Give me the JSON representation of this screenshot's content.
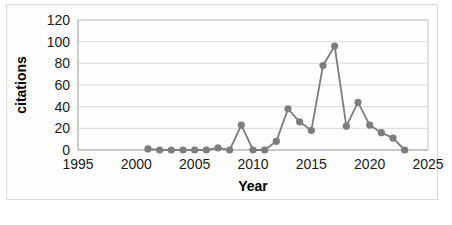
{
  "chart_data": {
    "type": "line",
    "title": "",
    "subtitle": "",
    "xlabel": "Year",
    "ylabel": "citations",
    "xlim": [
      1995,
      2025
    ],
    "ylim": [
      0,
      120
    ],
    "x_ticks": [
      1995,
      2000,
      2005,
      2010,
      2015,
      2020,
      2025
    ],
    "y_ticks": [
      0,
      20,
      40,
      60,
      80,
      100,
      120
    ],
    "grid": "horizontal",
    "legend": "none",
    "marker": "circle",
    "line_color": "#7d7d7d",
    "marker_color": "#7d7d7d",
    "x": [
      2001,
      2002,
      2003,
      2004,
      2005,
      2006,
      2007,
      2008,
      2009,
      2010,
      2011,
      2012,
      2013,
      2014,
      2015,
      2016,
      2017,
      2018,
      2019,
      2020,
      2021,
      2022,
      2023
    ],
    "values": [
      1,
      0,
      0,
      0,
      0,
      0,
      2,
      0,
      23,
      0,
      0,
      8,
      38,
      26,
      18,
      78,
      96,
      22,
      44,
      23,
      16,
      11,
      0
    ],
    "series": [
      {
        "name": "citations",
        "values": [
          1,
          0,
          0,
          0,
          0,
          0,
          2,
          0,
          23,
          0,
          0,
          8,
          38,
          26,
          18,
          78,
          96,
          22,
          44,
          23,
          16,
          11,
          0
        ]
      }
    ]
  },
  "axes": {
    "y_tick_labels": [
      "120",
      "100",
      "80",
      "60",
      "40",
      "20",
      "0"
    ],
    "x_tick_labels": [
      "1995",
      "2000",
      "2005",
      "2010",
      "2015",
      "2020",
      "2025"
    ],
    "y_axis_title": "citations",
    "x_axis_title": "Year"
  }
}
